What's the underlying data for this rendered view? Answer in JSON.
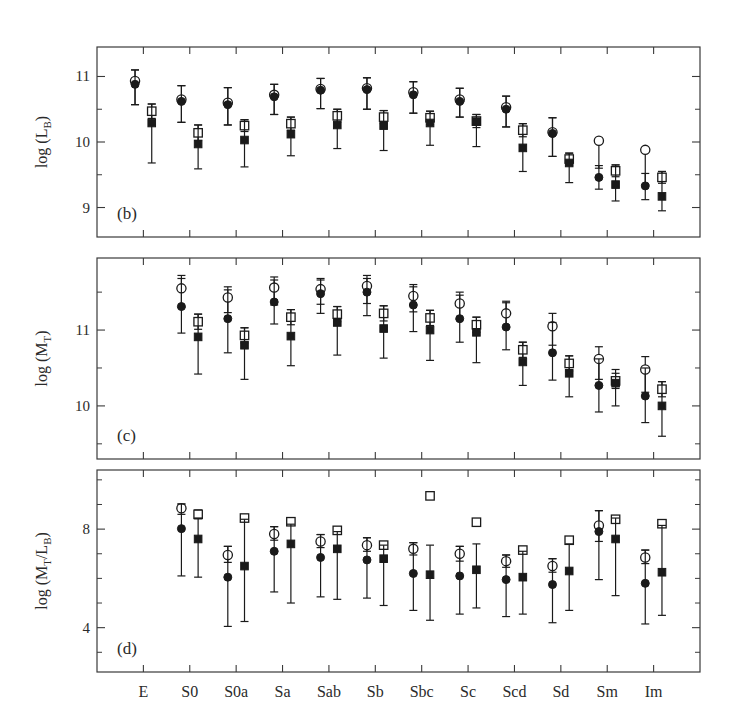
{
  "figure": {
    "background": "#ffffff",
    "ink": "#1a1a1a",
    "categories": [
      "E",
      "S0",
      "S0a",
      "Sa",
      "Sab",
      "Sb",
      "Sbc",
      "Sc",
      "Scd",
      "Sd",
      "Sm",
      "Im"
    ],
    "series_names": [
      "open-circle",
      "filled-circle",
      "open-square",
      "filled-square"
    ]
  },
  "chart_data": [
    {
      "type": "scatter",
      "panel": "b",
      "panel_label": "(b)",
      "title": "",
      "xlabel": "",
      "ylabel": "log (L_B)",
      "ylabel_main": "log (L",
      "ylabel_sub": "B",
      "ylabel_tail": ")",
      "ylim": [
        8.55,
        11.45
      ],
      "yticks": [
        9,
        10,
        11
      ],
      "ytick_labels": [
        "9",
        "10",
        "11"
      ],
      "yminor": [
        8.5,
        9.5,
        10.5,
        11.5
      ],
      "grid": false,
      "legend": "none",
      "categories": [
        "E",
        "S0",
        "S0a",
        "Sa",
        "Sab",
        "Sb",
        "Sbc",
        "Sc",
        "Scd",
        "Sd",
        "Sm",
        "Im"
      ],
      "series": [
        {
          "name": "open-circle",
          "marker": "open-circle",
          "dx": -0.18,
          "values": [
            10.93,
            10.65,
            10.6,
            10.72,
            10.81,
            10.82,
            10.76,
            10.65,
            10.53,
            10.15,
            10.02,
            9.88
          ],
          "err_low": [
            10.57,
            10.3,
            10.26,
            10.42,
            10.51,
            10.5,
            10.44,
            10.38,
            10.23,
            9.78,
            9.6,
            9.35
          ],
          "err_high": [
            11.1,
            10.86,
            10.83,
            10.88,
            10.97,
            10.98,
            10.92,
            10.82,
            10.7,
            10.37,
            10.02,
            9.88
          ]
        },
        {
          "name": "filled-circle",
          "marker": "filled-circle",
          "dx": -0.18,
          "values": [
            10.88,
            10.62,
            10.57,
            10.69,
            10.79,
            10.8,
            10.72,
            10.62,
            10.5,
            10.13,
            9.46,
            9.33
          ],
          "err_low": [
            10.57,
            10.3,
            10.26,
            10.42,
            10.51,
            10.5,
            10.44,
            10.38,
            10.23,
            9.78,
            9.28,
            9.12
          ],
          "err_high": [
            11.1,
            10.86,
            10.83,
            10.88,
            10.97,
            10.98,
            10.92,
            10.82,
            10.7,
            10.37,
            9.64,
            9.52
          ]
        },
        {
          "name": "open-square",
          "marker": "open-square",
          "dx": 0.18,
          "values": [
            10.47,
            10.14,
            10.25,
            10.28,
            10.4,
            10.38,
            10.37,
            10.32,
            10.18,
            9.74,
            9.56,
            9.46
          ],
          "err_low": [
            10.36,
            10.02,
            10.16,
            10.18,
            10.3,
            10.28,
            10.27,
            10.22,
            10.08,
            9.65,
            9.47,
            9.37
          ],
          "err_high": [
            10.58,
            10.26,
            10.34,
            10.38,
            10.5,
            10.48,
            10.47,
            10.42,
            10.28,
            9.83,
            9.65,
            9.55
          ]
        },
        {
          "name": "filled-square",
          "marker": "filled-square",
          "dx": 0.18,
          "values": [
            10.29,
            9.97,
            10.03,
            10.12,
            10.26,
            10.25,
            10.29,
            10.31,
            9.91,
            9.68,
            9.35,
            9.17
          ],
          "err_low": [
            9.68,
            9.59,
            9.62,
            9.79,
            9.9,
            9.87,
            9.95,
            9.93,
            9.55,
            9.38,
            9.1,
            8.95
          ],
          "err_high": [
            10.58,
            10.26,
            10.34,
            10.38,
            10.5,
            10.48,
            10.47,
            10.42,
            10.28,
            9.83,
            9.65,
            9.55
          ]
        }
      ]
    },
    {
      "type": "scatter",
      "panel": "c",
      "panel_label": "(c)",
      "title": "",
      "xlabel": "",
      "ylabel": "log (M_T)",
      "ylabel_main": "log (M",
      "ylabel_sub": "T",
      "ylabel_tail": ")",
      "ylim": [
        9.3,
        11.95
      ],
      "yticks": [
        10,
        11
      ],
      "ytick_labels": [
        "10",
        "11"
      ],
      "yminor": [
        9.5,
        10.5,
        11.5
      ],
      "grid": false,
      "legend": "none",
      "categories": [
        "E",
        "S0",
        "S0a",
        "Sa",
        "Sab",
        "Sb",
        "Sbc",
        "Sc",
        "Scd",
        "Sd",
        "Sm",
        "Im"
      ],
      "series": [
        {
          "name": "open-circle",
          "marker": "open-circle",
          "dx": -0.18,
          "values": [
            null,
            11.55,
            11.43,
            11.56,
            11.54,
            11.58,
            11.45,
            11.35,
            11.22,
            11.05,
            10.62,
            10.48
          ],
          "err_low": [
            null,
            11.3,
            11.23,
            11.33,
            11.34,
            11.35,
            11.24,
            11.14,
            11.03,
            10.8,
            10.35,
            10.18
          ],
          "err_high": [
            null,
            11.72,
            11.57,
            11.7,
            11.68,
            11.72,
            11.6,
            11.5,
            11.38,
            11.22,
            10.78,
            10.65
          ]
        },
        {
          "name": "filled-circle",
          "marker": "filled-circle",
          "dx": -0.18,
          "values": [
            null,
            11.31,
            11.15,
            11.37,
            11.48,
            11.5,
            11.33,
            11.15,
            11.04,
            10.7,
            10.27,
            10.13
          ],
          "err_low": [
            null,
            10.96,
            10.7,
            11.08,
            11.22,
            11.19,
            10.98,
            10.84,
            10.74,
            10.34,
            9.92,
            9.78
          ],
          "err_high": [
            null,
            11.68,
            11.53,
            11.66,
            11.66,
            11.68,
            11.57,
            11.46,
            11.36,
            11.1,
            10.62,
            10.5
          ]
        },
        {
          "name": "open-square",
          "marker": "open-square",
          "dx": 0.18,
          "values": [
            null,
            11.11,
            10.93,
            11.17,
            11.21,
            11.22,
            11.16,
            11.07,
            10.74,
            10.56,
            10.33,
            10.22
          ],
          "err_low": [
            null,
            11.01,
            10.83,
            11.07,
            11.11,
            11.12,
            11.06,
            10.97,
            10.64,
            10.46,
            10.23,
            10.12
          ],
          "err_high": [
            null,
            11.21,
            11.03,
            11.27,
            11.31,
            11.32,
            11.26,
            11.17,
            10.84,
            10.66,
            10.43,
            10.32
          ]
        },
        {
          "name": "filled-square",
          "marker": "filled-square",
          "dx": 0.18,
          "values": [
            null,
            10.91,
            10.8,
            10.92,
            11.1,
            11.02,
            11.0,
            10.97,
            10.58,
            10.43,
            10.3,
            10.0
          ],
          "err_low": [
            null,
            10.42,
            10.35,
            10.53,
            10.67,
            10.63,
            10.6,
            10.57,
            10.27,
            10.12,
            10.0,
            9.6
          ],
          "err_high": [
            null,
            11.21,
            11.03,
            11.27,
            11.31,
            11.32,
            11.26,
            11.17,
            10.84,
            10.66,
            10.48,
            10.32
          ]
        }
      ]
    },
    {
      "type": "scatter",
      "panel": "d",
      "panel_label": "(d)",
      "title": "",
      "xlabel": "",
      "ylabel": "log (M_T/L_B)",
      "ylabel_main": "log (M",
      "ylabel_sub": "T",
      "ylabel_mid": "/L",
      "ylabel_sub2": "B",
      "ylabel_tail": ")",
      "ylim": [
        2.2,
        10.4
      ],
      "yticks": [
        4,
        8
      ],
      "ytick_labels": [
        "4",
        "8"
      ],
      "yminor": [
        3,
        5,
        6,
        7,
        9,
        10
      ],
      "grid": false,
      "legend": "none",
      "categories": [
        "E",
        "S0",
        "S0a",
        "Sa",
        "Sab",
        "Sb",
        "Sbc",
        "Sc",
        "Scd",
        "Sd",
        "Sm",
        "Im"
      ],
      "series": [
        {
          "name": "open-circle",
          "marker": "open-circle",
          "dx": -0.18,
          "values": [
            null,
            8.85,
            6.95,
            7.8,
            7.5,
            7.35,
            7.2,
            7.0,
            6.7,
            6.5,
            8.15,
            6.85
          ],
          "err_low": [
            null,
            8.6,
            6.65,
            7.55,
            7.25,
            7.1,
            6.95,
            6.7,
            6.45,
            6.25,
            7.5,
            6.6
          ],
          "err_high": [
            null,
            9.02,
            7.3,
            8.1,
            7.78,
            7.65,
            7.45,
            7.3,
            6.95,
            6.8,
            8.75,
            7.15
          ]
        },
        {
          "name": "filled-circle",
          "marker": "filled-circle",
          "dx": -0.18,
          "values": [
            null,
            8.02,
            6.05,
            7.1,
            6.85,
            6.75,
            6.2,
            6.1,
            5.95,
            5.75,
            7.9,
            5.8
          ],
          "err_low": [
            null,
            6.1,
            4.05,
            5.45,
            5.25,
            5.2,
            4.7,
            4.55,
            4.45,
            4.2,
            5.95,
            4.15
          ],
          "err_high": [
            null,
            9.02,
            7.3,
            8.1,
            7.78,
            7.65,
            7.45,
            7.3,
            6.95,
            6.8,
            8.75,
            7.15
          ]
        },
        {
          "name": "open-square",
          "marker": "open-square",
          "dx": 0.18,
          "values": [
            null,
            8.6,
            8.45,
            8.3,
            7.95,
            7.35,
            9.35,
            8.28,
            7.15,
            7.55,
            8.4,
            8.22
          ],
          "err_low": [
            null,
            8.42,
            8.45,
            8.3,
            7.85,
            7.25,
            9.35,
            8.28,
            7.05,
            7.45,
            8.3,
            8.22
          ],
          "err_high": [
            null,
            8.78,
            8.45,
            8.3,
            8.05,
            7.45,
            9.35,
            8.28,
            7.25,
            7.65,
            8.5,
            8.22
          ]
        },
        {
          "name": "filled-square",
          "marker": "filled-square",
          "dx": 0.18,
          "values": [
            null,
            7.6,
            6.5,
            7.4,
            7.2,
            6.8,
            6.15,
            6.35,
            6.05,
            6.3,
            7.6,
            6.25
          ],
          "err_low": [
            null,
            6.05,
            4.25,
            5.0,
            5.15,
            4.9,
            4.3,
            4.8,
            4.55,
            4.7,
            5.3,
            4.5
          ],
          "err_high": [
            null,
            8.45,
            8.4,
            8.2,
            7.9,
            7.35,
            7.35,
            7.4,
            7.1,
            7.4,
            8.45,
            8.15
          ]
        }
      ]
    }
  ]
}
